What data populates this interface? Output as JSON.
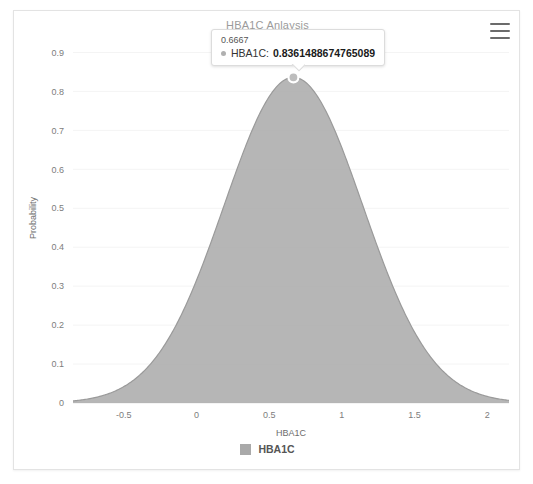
{
  "card": {
    "title": "HBA1C Anlaysis",
    "menu_icon": "hamburger-menu-icon"
  },
  "tooltip": {
    "x_value": "0.6667",
    "series_name": "HBA1C",
    "value": "0.8361488674765089",
    "marker_icon": "series-dot-icon"
  },
  "legend": {
    "items": [
      {
        "label": "HBA1C",
        "color": "#a9a9a9"
      }
    ]
  },
  "chart_data": {
    "type": "area",
    "title": "HBA1C Anlaysis",
    "xlabel": "HBA1C",
    "ylabel": "Probability",
    "xlim": [
      -0.85,
      2.15
    ],
    "ylim": [
      0,
      0.95
    ],
    "xticks": [
      "-0.5",
      "0",
      "0.5",
      "1",
      "1.5",
      "2"
    ],
    "xtick_values": [
      -0.5,
      0,
      0.5,
      1,
      1.5,
      2
    ],
    "yticks": [
      "0",
      "0.1",
      "0.2",
      "0.3",
      "0.4",
      "0.5",
      "0.6",
      "0.7",
      "0.8",
      "0.9"
    ],
    "ytick_values": [
      0,
      0.1,
      0.2,
      0.3,
      0.4,
      0.5,
      0.6,
      0.7,
      0.8,
      0.9
    ],
    "grid": true,
    "legend_position": "bottom",
    "series": [
      {
        "name": "HBA1C",
        "color": "#a9a9a9",
        "distribution": "normal",
        "mean": 0.6667,
        "sigma": 0.4772,
        "peak_x": 0.6667,
        "peak_y": 0.8361488674765089,
        "x": [
          -0.85,
          -0.75,
          -0.65,
          -0.55,
          -0.45,
          -0.35,
          -0.25,
          -0.15,
          -0.05,
          0.05,
          0.15,
          0.25,
          0.35,
          0.45,
          0.55,
          0.6667,
          0.75,
          0.85,
          0.95,
          1.05,
          1.15,
          1.25,
          1.35,
          1.45,
          1.55,
          1.65,
          1.75,
          1.85,
          1.95,
          2.05,
          2.15
        ],
        "values": [
          0.0056,
          0.0098,
          0.0165,
          0.0267,
          0.0416,
          0.0624,
          0.09,
          0.1248,
          0.1664,
          0.2134,
          0.2633,
          0.3128,
          0.3581,
          0.3954,
          0.4215,
          0.8361,
          0.8317,
          0.811,
          0.7697,
          0.7101,
          0.6363,
          0.5536,
          0.4673,
          0.3823,
          0.3026,
          0.2318,
          0.1717,
          0.123,
          0.0852,
          0.057,
          0.0369
        ]
      }
    ],
    "highlight_point": {
      "x": 0.6667,
      "y": 0.8361488674765089
    }
  }
}
